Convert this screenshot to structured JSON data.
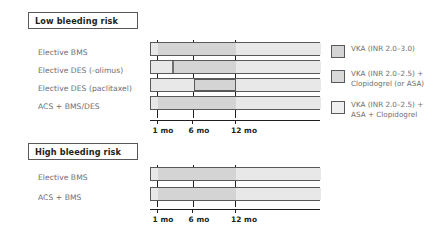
{
  "figure": {
    "axis": {
      "ticks": [
        {
          "label": "1 mo",
          "months": 1
        },
        {
          "label": "6 mo",
          "months": 6
        },
        {
          "label": "12 mo",
          "months": 12
        }
      ],
      "range_months": [
        0,
        24
      ]
    },
    "colors": {
      "vka_alone": "#e8e8e8",
      "vka_clopidogrel": "#d4d4d4",
      "triple_therapy": "#f2f2f2",
      "outline": "#58595b",
      "label_text": "#6d6e71",
      "header_text": "#231f20"
    },
    "sections": [
      {
        "id": "low-bleeding-risk",
        "header": "Low bleeding risk",
        "rows": [
          {
            "label": "Elective BMS",
            "segments": [
              {
                "regimen": "triple",
                "start_months": 0,
                "end_months": 1,
                "fill": "light"
              },
              {
                "regimen": "vka-clopidogrel",
                "start_months": 1,
                "end_months": 12,
                "fill": "mid"
              },
              {
                "regimen": "vka",
                "start_months": 12,
                "end_months": 24,
                "fill": "light"
              }
            ]
          },
          {
            "label": "Elective DES (-olimus)",
            "segments": [
              {
                "regimen": "triple",
                "start_months": 0,
                "end_months": 1,
                "fill": "light"
              },
              {
                "regimen": "vka-clopidogrel",
                "start_months": 1,
                "end_months": 12,
                "fill": "mid"
              },
              {
                "regimen": "vka",
                "start_months": 12,
                "end_months": 24,
                "fill": "light"
              }
            ]
          },
          {
            "label": "Elective DES (paclitaxel)",
            "segments": [
              {
                "regimen": "triple",
                "start_months": 0,
                "end_months": 6,
                "fill": "light"
              },
              {
                "regimen": "vka-clopidogrel",
                "start_months": 6,
                "end_months": 12,
                "fill": "mid"
              },
              {
                "regimen": "vka",
                "start_months": 12,
                "end_months": 24,
                "fill": "light"
              }
            ]
          },
          {
            "label": "ACS + BMS/DES",
            "segments": [
              {
                "regimen": "triple",
                "start_months": 0,
                "end_months": 1,
                "fill": "light"
              },
              {
                "regimen": "vka-clopidogrel",
                "start_months": 1,
                "end_months": 12,
                "fill": "mid"
              },
              {
                "regimen": "vka",
                "start_months": 12,
                "end_months": 24,
                "fill": "light"
              }
            ]
          }
        ]
      },
      {
        "id": "high-bleeding-risk",
        "header": "High bleeding risk",
        "rows": [
          {
            "label": "Elective BMS",
            "segments": [
              {
                "regimen": "triple",
                "start_months": 0,
                "end_months": 1,
                "fill": "light"
              },
              {
                "regimen": "vka-clopidogrel",
                "start_months": 1,
                "end_months": 12,
                "fill": "mid"
              },
              {
                "regimen": "vka",
                "start_months": 12,
                "end_months": 24,
                "fill": "light"
              }
            ]
          },
          {
            "label": "ACS + BMS",
            "segments": [
              {
                "regimen": "triple",
                "start_months": 0,
                "end_months": 1,
                "fill": "light"
              },
              {
                "regimen": "vka-clopidogrel",
                "start_months": 1,
                "end_months": 12,
                "fill": "mid"
              },
              {
                "regimen": "vka",
                "start_months": 12,
                "end_months": 24,
                "fill": "light"
              }
            ]
          }
        ]
      }
    ],
    "legend": [
      {
        "swatch_fill": "#d4d4d4",
        "text": "VKA (INR 2.0–3.0)"
      },
      {
        "swatch_fill": "#d9d9d9",
        "text": "VKA (INR 2.0–2.5) +\nClopidogrel (or ASA)"
      },
      {
        "swatch_fill": "#efefef",
        "text": "VKA (INR 2.0–2.5) +\nASA + Clopidogrel"
      }
    ]
  }
}
